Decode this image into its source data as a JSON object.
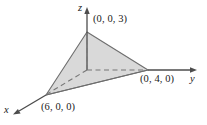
{
  "figure": {
    "background_color": "#ffffff",
    "plane": {
      "fill_color": "#d9d9d9",
      "stroke_color": "#6e6e6e",
      "description": "Shaded triangular region of the plane cutting the three axes"
    },
    "axes": [
      {
        "name": "x",
        "label": "x",
        "direction": "down-left",
        "style": "solid-with-arrow"
      },
      {
        "name": "y",
        "label": "y",
        "direction": "right",
        "style": "solid-with-arrow"
      },
      {
        "name": "z",
        "label": "z",
        "direction": "up",
        "style": "solid-with-arrow"
      }
    ],
    "axis_color": "#4d4d4d",
    "hidden_edge_color": "#777777",
    "points": [
      {
        "id": "z_intercept",
        "label": "(0, 0, 3)",
        "coords": [
          0,
          0,
          3
        ]
      },
      {
        "id": "y_intercept",
        "label": "(0, 4, 0)",
        "coords": [
          0,
          4,
          0
        ]
      },
      {
        "id": "x_intercept",
        "label": "(6, 0, 0)",
        "coords": [
          6,
          0,
          0
        ]
      }
    ]
  }
}
